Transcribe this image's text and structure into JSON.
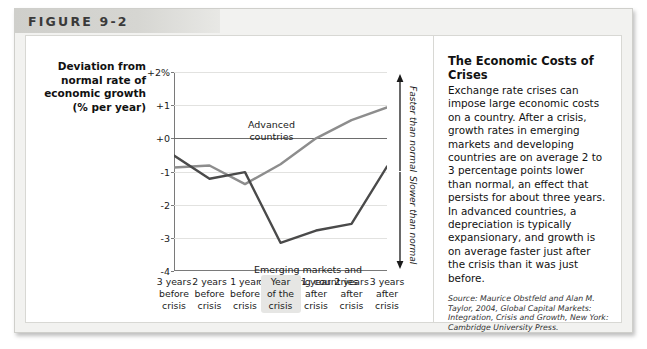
{
  "figure": {
    "header_label": "FIGURE 9-2"
  },
  "chart_data": {
    "type": "line",
    "title": "",
    "ylabel": "Deviation from normal rate of economic growth (% per year)",
    "xlabel": "",
    "ylim": [
      -4,
      2
    ],
    "yticks": [
      "+2%",
      "+1",
      "+0",
      "-1",
      "-2",
      "-3",
      "-4"
    ],
    "ytick_values": [
      2,
      1,
      0,
      -1,
      -2,
      -3,
      -4
    ],
    "grid": true,
    "zero_line": 0,
    "legend_position": "inline-annotation",
    "categories": [
      "3 years before crisis",
      "2 years before crisis",
      "1 year before crisis",
      "Year of the crisis",
      "1 year after crisis",
      "2 years after crisis",
      "3 years after crisis"
    ],
    "series": [
      {
        "name": "Advanced countries",
        "color": "#8d8d8d",
        "values": [
          -0.88,
          -0.82,
          -1.38,
          -0.78,
          0.0,
          0.55,
          0.93
        ]
      },
      {
        "name": "Emerging markets and developing countries",
        "color": "#4a4a4a",
        "values": [
          -0.52,
          -1.22,
          -1.02,
          -3.15,
          -2.78,
          -2.58,
          -0.85
        ]
      }
    ],
    "annotations": [
      {
        "text": "Advanced countries",
        "series": "Advanced countries"
      },
      {
        "text": "Emerging markets and developing countries",
        "series": "Emerging markets and developing countries"
      },
      {
        "text": "Faster than normal",
        "region": "above-zero"
      },
      {
        "text": "Slower than normal",
        "region": "below-zero"
      }
    ]
  },
  "axis": {
    "title_line1": "Deviation from",
    "title_line2": "normal rate of",
    "title_line3": "economic growth",
    "title_line4": "(% per year)"
  },
  "xlabels": [
    {
      "line1": "3 years",
      "line2": "before",
      "line3": "crisis",
      "highlight": false
    },
    {
      "line1": "2 years",
      "line2": "before",
      "line3": "crisis",
      "highlight": false
    },
    {
      "line1": "1 year",
      "line2": "before",
      "line3": "crisis",
      "highlight": false
    },
    {
      "line1": "Year",
      "line2": "of the",
      "line3": "crisis",
      "highlight": true
    },
    {
      "line1": "1 year",
      "line2": "after",
      "line3": "crisis",
      "highlight": false
    },
    {
      "line1": "2 years",
      "line2": "after",
      "line3": "crisis",
      "highlight": false
    },
    {
      "line1": "3 years",
      "line2": "after",
      "line3": "crisis",
      "highlight": false
    }
  ],
  "series_labels": {
    "advanced_line1": "Advanced",
    "advanced_line2": "countries",
    "emerging_line1": "Emerging markets and",
    "emerging_line2": "developing countries"
  },
  "bracket": {
    "faster": "Faster than normal",
    "slower": "Slower than normal"
  },
  "sidebar": {
    "heading": "The Economic Costs of Crises",
    "body": "Exchange rate crises can impose large economic costs on a country. After a crisis, growth rates in emerging markets and developing countries are on average 2 to 3 percentage points lower than normal, an effect that persists for about three years. In advanced countries, a depreciation is typically expansionary, and growth is on average faster just after the crisis than it was just before.",
    "source": "Source: Maurice Obstfeld and Alan M. Taylor, 2004, Global Capital Markets: Integration, Crisis and Growth, New York: Cambridge University Press."
  }
}
